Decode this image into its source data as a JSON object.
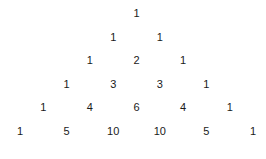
{
  "rows": [
    [
      1
    ],
    [
      1,
      1
    ],
    [
      1,
      2,
      1
    ],
    [
      1,
      3,
      3,
      1
    ],
    [
      1,
      4,
      6,
      4,
      1
    ],
    [
      1,
      5,
      10,
      10,
      5,
      1
    ]
  ],
  "caption": "(a)"
}
